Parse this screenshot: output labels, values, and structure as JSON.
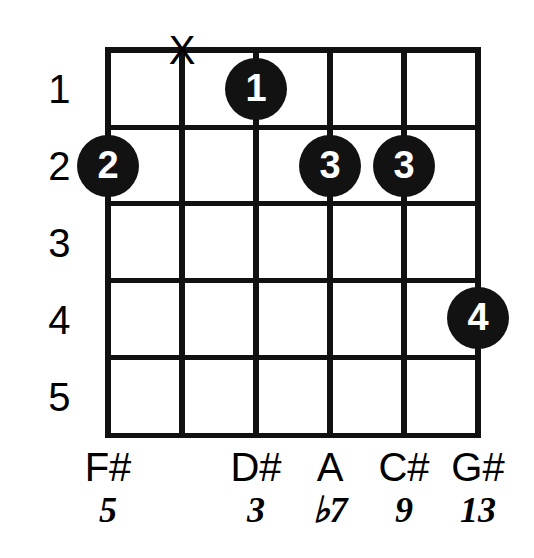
{
  "diagram": {
    "type": "guitar-chord-diagram",
    "strings_count": 6,
    "frets_count": 5,
    "fret_numbers": [
      "1",
      "2",
      "3",
      "4",
      "5"
    ],
    "colors": {
      "background": "#ffffff",
      "grid": "#111111",
      "dot_fill": "#121212",
      "dot_text": "#ffffff",
      "text": "#000000"
    },
    "string_markers": [
      {
        "string": 1,
        "marker": ""
      },
      {
        "string": 2,
        "marker": "X"
      },
      {
        "string": 3,
        "marker": ""
      },
      {
        "string": 4,
        "marker": ""
      },
      {
        "string": 5,
        "marker": ""
      },
      {
        "string": 6,
        "marker": ""
      }
    ],
    "finger_dots": [
      {
        "finger": "1",
        "string": 3,
        "fret": 1
      },
      {
        "finger": "2",
        "string": 1,
        "fret": 2
      },
      {
        "finger": "3",
        "string": 4,
        "fret": 2
      },
      {
        "finger": "3",
        "string": 5,
        "fret": 2
      },
      {
        "finger": "4",
        "string": 6,
        "fret": 4
      }
    ],
    "note_names": [
      "F#",
      "",
      "D#",
      "A",
      "C#",
      "G#"
    ],
    "intervals": [
      "5",
      "",
      "3",
      "♭7",
      "9",
      "13"
    ]
  }
}
